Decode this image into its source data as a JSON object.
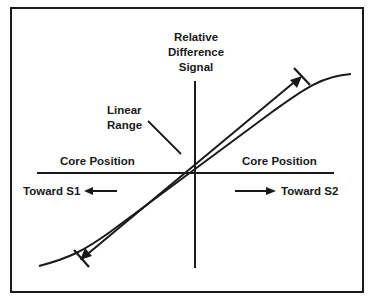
{
  "diagram": {
    "type": "transfer-characteristic",
    "y_axis_label": [
      "Relative",
      "Difference",
      "Signal"
    ],
    "x_axis_label_left": "Core Position",
    "x_axis_label_right": "Core Position",
    "direction_left": "Toward S1",
    "direction_right": "Toward S2",
    "annotation": [
      "Linear",
      "Range"
    ],
    "colors": {
      "ink": "#1a1a1a",
      "background": "#ffffff"
    }
  }
}
